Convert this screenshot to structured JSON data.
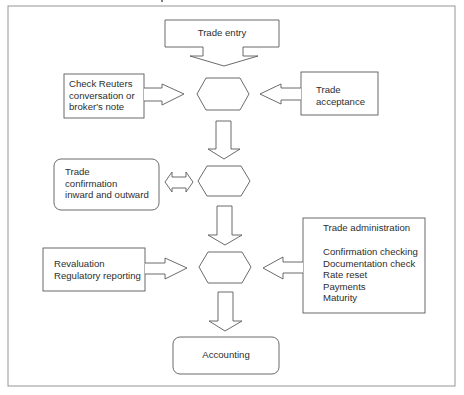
{
  "diagram": {
    "type": "flowchart",
    "frame": {
      "stroke": "#8a8a8a"
    },
    "stroke_color": "#5a5a5a",
    "nodes": {
      "trade_entry": {
        "label": "Trade entry",
        "shape": "down-arrow-callout"
      },
      "check_reuters": {
        "lines": [
          "Check Reuters",
          "conversation or",
          "broker's note"
        ],
        "shape": "rectangle"
      },
      "trade_acceptance": {
        "lines": [
          "Trade",
          "acceptance"
        ],
        "shape": "rectangle"
      },
      "hub_1": {
        "shape": "hexagon",
        "label": ""
      },
      "trade_confirmation": {
        "lines": [
          "Trade",
          "confirmation",
          "inward and outward"
        ],
        "shape": "rounded-rectangle"
      },
      "hub_2": {
        "shape": "hexagon",
        "label": ""
      },
      "revaluation": {
        "lines": [
          "Revaluation",
          "Regulatory reporting"
        ],
        "shape": "rectangle"
      },
      "trade_administration": {
        "title": "Trade administration",
        "lines": [
          "Confirmation checking",
          "Documentation check",
          "Rate reset",
          "Payments",
          "Maturity"
        ],
        "shape": "rectangle"
      },
      "hub_3": {
        "shape": "hexagon",
        "label": ""
      },
      "accounting": {
        "label": "Accounting",
        "shape": "rounded-rectangle"
      }
    },
    "edges": [
      {
        "from": "trade_entry",
        "to": "hub_1",
        "direction": "down"
      },
      {
        "from": "check_reuters",
        "to": "hub_1",
        "direction": "right"
      },
      {
        "from": "trade_acceptance",
        "to": "hub_1",
        "direction": "left"
      },
      {
        "from": "hub_1",
        "to": "hub_2",
        "direction": "down"
      },
      {
        "from": "trade_confirmation",
        "to": "hub_2",
        "direction": "bidirectional"
      },
      {
        "from": "hub_2",
        "to": "hub_3",
        "direction": "down"
      },
      {
        "from": "revaluation",
        "to": "hub_3",
        "direction": "right"
      },
      {
        "from": "trade_administration",
        "to": "hub_3",
        "direction": "left"
      },
      {
        "from": "hub_3",
        "to": "accounting",
        "direction": "down"
      }
    ]
  }
}
